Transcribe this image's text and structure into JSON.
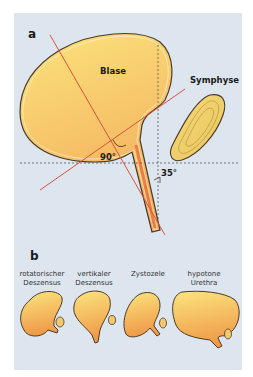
{
  "panel_a": {
    "letter": "a",
    "labels": {
      "bladder": "Blase",
      "symphysis": "Symphyse",
      "angle_posterior": "90°",
      "angle_urethra": "35°"
    }
  },
  "panel_b": {
    "letter": "b",
    "variants": [
      {
        "line1": "rotatorischer",
        "line2": "Deszensus"
      },
      {
        "line1": "vertikaler",
        "line2": "Deszensus"
      },
      {
        "line1": "Zystozele",
        "line2": ""
      },
      {
        "line1": "hypotone",
        "line2": "Urethra"
      }
    ]
  },
  "colors": {
    "background": "#dde6ef",
    "organ_fill_light": "#fbe27a",
    "organ_fill_dark": "#f0a050",
    "outline": "#5a4a3a",
    "axis_line": "#e0503a",
    "dashed_line": "#555555"
  }
}
